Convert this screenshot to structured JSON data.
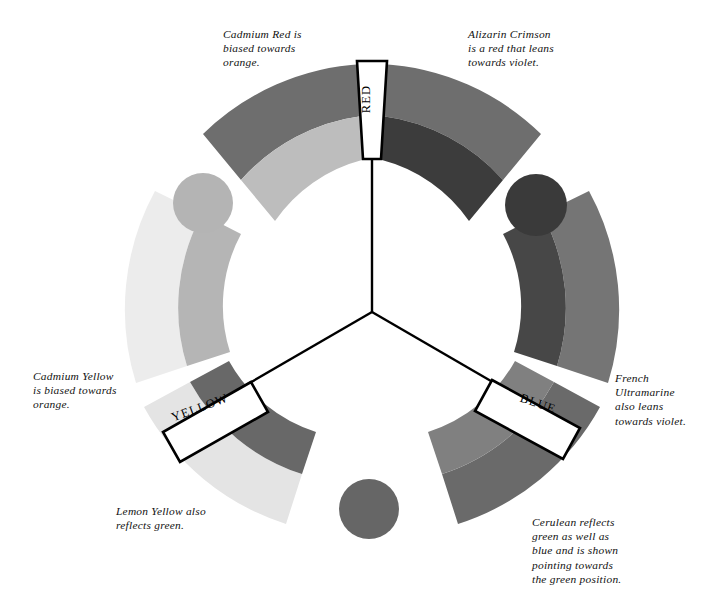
{
  "diagram": {
    "background_color": "#ffffff",
    "center": {
      "x": 372,
      "y": 312
    }
  },
  "primaries": [
    {
      "id": "red",
      "label": "RED",
      "position": "top"
    },
    {
      "id": "yellow",
      "label": "YELLOW",
      "position": "lower-left"
    },
    {
      "id": "blue",
      "label": "BLUE",
      "position": "lower-right"
    }
  ],
  "captions": {
    "cadmium_red": "Cadmium Red is\nbiased towards\norange.",
    "alizarin_crimson": "Alizarin Crimson\nis a red that leans\ntowards violet.",
    "cadmium_yellow": "Cadmium Yellow\nis biased towards\norange.",
    "french_ultramarine": "French\nUltramarine\nalso  leans\ntowards violet.",
    "lemon_yellow": "Lemon Yellow also\nreflects green.",
    "cerulean": "Cerulean reflects\ngreen as well as\nblue and is shown\npointing towards\nthe green position."
  },
  "segments": [
    {
      "id": "cadmium-red-arc",
      "pigment": "Cadmium Red",
      "outer_color": "#6e6e6e",
      "inner_color": "#bdbdbd",
      "bias": "orange"
    },
    {
      "id": "alizarin-crimson-arc",
      "pigment": "Alizarin Crimson",
      "outer_color": "#6e6e6e",
      "inner_color": "#3c3c3c",
      "bias": "violet"
    },
    {
      "id": "french-ultramarine-arc",
      "pigment": "French Ultramarine",
      "outer_color": "#757575",
      "inner_color": "#474747",
      "bias": "violet"
    },
    {
      "id": "cerulean-arc",
      "pigment": "Cerulean",
      "outer_color": "#6a6a6a",
      "inner_color": "#808080",
      "bias": "green"
    },
    {
      "id": "lemon-yellow-arc",
      "pigment": "Lemon Yellow",
      "outer_color": "#e4e4e4",
      "inner_color": "#686868",
      "bias": "green"
    },
    {
      "id": "cadmium-yellow-arc",
      "pigment": "Cadmium Yellow",
      "outer_color": "#ececec",
      "inner_color": "#b5b5b5",
      "bias": "orange"
    }
  ],
  "secondary_circles": [
    {
      "id": "orange-circle",
      "name": "orange",
      "color": "#b4b4b4",
      "cx": 203,
      "cy": 203,
      "r": 30
    },
    {
      "id": "violet-circle",
      "name": "violet",
      "color": "#3a3a3a",
      "cx": 536,
      "cy": 205,
      "r": 31
    },
    {
      "id": "green-circle",
      "name": "green",
      "color": "#666666",
      "cx": 369,
      "cy": 509,
      "r": 30
    }
  ],
  "spokes": {
    "stroke_color": "#000000",
    "stroke_width": 2.4
  },
  "label_boxes": {
    "fill": "#ffffff",
    "stroke": "#000000",
    "stroke_width": 2.6
  }
}
